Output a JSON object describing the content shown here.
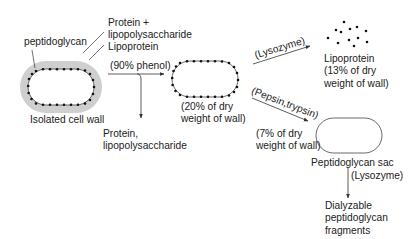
{
  "diagram": {
    "type": "flowchart",
    "colors": {
      "line": "#333333",
      "outer_membrane_shade": "#cfcfcf",
      "dot": "#111111",
      "background": "#ffffff"
    },
    "nodes": {
      "isolated_cell_wall": {
        "label": "Isolated cell wall",
        "callouts": {
          "peptidoglycan": "peptidoglycan",
          "protein_lps": "Protein +\nlipopolysaccharide",
          "lipoprotein": "Lipoprotein"
        }
      },
      "phenol_extract": {
        "label": "Protein,\nlipopolysaccharide"
      },
      "phenol_residue": {
        "label": "(20% of dry\nweight of wall)"
      },
      "lipoprotein": {
        "label": "Lipoprotein\n(13% of dry\nweight of wall)"
      },
      "peptidoglycan_sac": {
        "label": "Peptidoglycan sac",
        "note": "(7% of dry\nweight of wall)"
      },
      "fragments": {
        "label": "Dialyzable\npeptidoglycan\nfragments"
      }
    },
    "edges": [
      {
        "from": "isolated_cell_wall",
        "to": "phenol_residue",
        "label": "(90% phenol)"
      },
      {
        "from": "isolated_cell_wall",
        "to": "phenol_extract",
        "label": ""
      },
      {
        "from": "phenol_residue",
        "to": "lipoprotein",
        "label": "(Lysozyme)"
      },
      {
        "from": "phenol_residue",
        "to": "peptidoglycan_sac",
        "label": "(Pepsin,trypsin)"
      },
      {
        "from": "peptidoglycan_sac",
        "to": "fragments",
        "label": "(Lysozyme)"
      }
    ]
  }
}
